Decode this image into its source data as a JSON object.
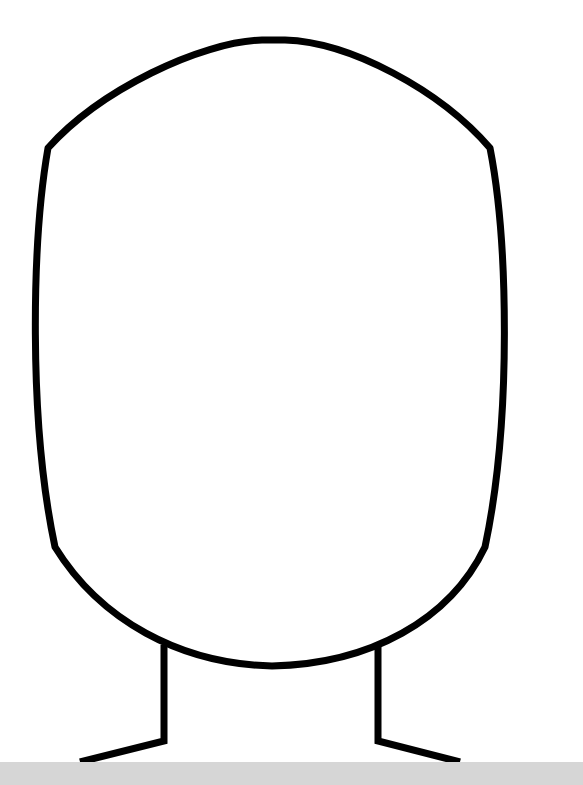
{
  "image": {
    "title": "Blank face outline template",
    "description": "Head and neck outline with shoulders, no facial features"
  },
  "colors": {
    "background": "#ffffff",
    "outline": "#000000",
    "bottom_bar": "#d6d6d6"
  },
  "stroke_width": 7,
  "shapes": {
    "head": "M 48 148 C 100 90, 200 42, 262 40 L 285 40 C 350 42, 440 90, 490 148 C 508 240, 512 420, 485 547 C 450 620, 370 664, 272 666 C 180 664, 100 620, 55 547 C 28 420, 32 240, 48 148 Z",
    "neck_left": "M 164 645 L 164 741 L 80 762",
    "neck_right": "M 378 645 L 378 741 L 460 762"
  }
}
